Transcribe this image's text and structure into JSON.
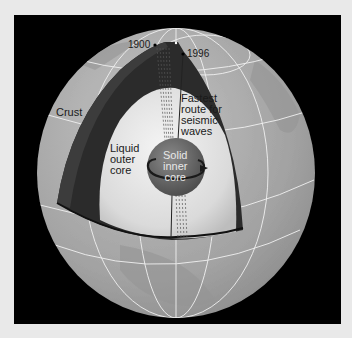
{
  "diagram": {
    "labels": {
      "year_1900": "1900",
      "year_1996": "1996",
      "crust": "Crust",
      "fastest_route": "Fastest\nroute for\nseismic\nwaves",
      "liquid_outer_core": "Liquid\nouter\ncore",
      "solid_inner_core": "Solid\ninner\ncore"
    },
    "colors": {
      "frame": "#e9e9e9",
      "panel": "#000000",
      "globe_surface": "#a6a6a6",
      "mantle": "#2b2b2b",
      "outer_core": "#dcdcdc",
      "inner_core": "#6b6b6b",
      "grid_lines": "#f2f2f2"
    }
  }
}
